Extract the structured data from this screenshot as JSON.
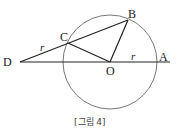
{
  "figure": {
    "caption": "[그림 4]",
    "points": {
      "A": {
        "label": "A",
        "x": 156,
        "y": 62
      },
      "B": {
        "label": "B",
        "x": 128,
        "y": 20
      },
      "C": {
        "label": "C",
        "x": 68,
        "y": 43
      },
      "D": {
        "label": "D",
        "x": 20,
        "y": 62
      },
      "O": {
        "label": "O",
        "x": 110,
        "y": 62
      }
    },
    "circle": {
      "center": "O",
      "radius": 47
    },
    "segment_labels": {
      "DC": "r",
      "OA": "r"
    },
    "colors": {
      "stroke": "#222222",
      "circle": "#555555"
    }
  }
}
